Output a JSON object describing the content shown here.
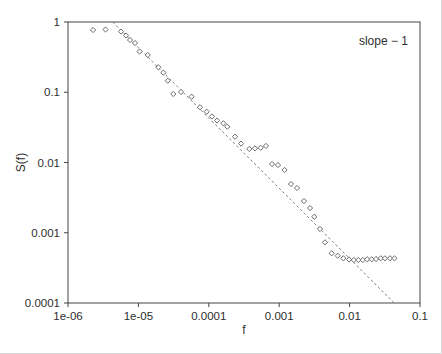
{
  "figure": {
    "background": "#ffffff",
    "frame_color": "#454545",
    "text_color": "#2e2e2e",
    "marker_color": "#6b6b6b",
    "marker_fill": "#ffffff",
    "dash_line_color": "#7d7d7d"
  },
  "chart_data": {
    "type": "scatter",
    "title": "",
    "xlabel": "f",
    "ylabel": "S(f)",
    "x_scale": "log",
    "y_scale": "log",
    "xlim": [
      1e-06,
      0.1
    ],
    "ylim": [
      0.0001,
      1
    ],
    "grid": false,
    "legend": "none",
    "x_ticks": [
      {
        "value": 1e-06,
        "label": "1e-06"
      },
      {
        "value": 1e-05,
        "label": "1e-05"
      },
      {
        "value": 0.0001,
        "label": "0.0001"
      },
      {
        "value": 0.001,
        "label": "0.001"
      },
      {
        "value": 0.01,
        "label": "0.01"
      },
      {
        "value": 0.1,
        "label": "0.1"
      }
    ],
    "y_ticks": [
      {
        "value": 1,
        "label": "1"
      },
      {
        "value": 0.1,
        "label": "0.1"
      },
      {
        "value": 0.01,
        "label": "0.01"
      },
      {
        "value": 0.001,
        "label": "0.001"
      },
      {
        "value": 0.0001,
        "label": "0.0001"
      }
    ],
    "annotation": {
      "text": "slope − 1",
      "f": 0.0675,
      "S": 0.47,
      "anchor": "end"
    },
    "reference_line": {
      "style": "dashed",
      "slope": -1,
      "points": [
        [
          4.3e-06,
          1.0
        ],
        [
          0.043,
          0.0001
        ]
      ]
    },
    "series": [
      {
        "name": "spectrum",
        "marker": "open-diamond",
        "points": [
          [
            2.27e-06,
            0.769
          ],
          [
            3.41e-06,
            0.782
          ],
          [
            5.66e-06,
            0.732
          ],
          [
            6.67e-06,
            0.642
          ],
          [
            7.6e-06,
            0.554
          ],
          [
            8.95e-06,
            0.502
          ],
          [
            1.04e-05,
            0.38
          ],
          [
            1.36e-05,
            0.339
          ],
          [
            1.92e-05,
            0.227
          ],
          [
            2.26e-05,
            0.19
          ],
          [
            2.61e-05,
            0.146
          ],
          [
            3.13e-05,
            0.0944
          ],
          [
            4.03e-05,
            0.101
          ],
          [
            5.71e-05,
            0.0864
          ],
          [
            7.5e-05,
            0.0611
          ],
          [
            9.34e-05,
            0.0529
          ],
          [
            0.000111,
            0.0452
          ],
          [
            0.000131,
            0.0396
          ],
          [
            0.000161,
            0.0361
          ],
          [
            0.000183,
            0.0323
          ],
          [
            0.000236,
            0.0233
          ],
          [
            0.000287,
            0.0186
          ],
          [
            0.000376,
            0.0156
          ],
          [
            0.000453,
            0.0159
          ],
          [
            0.000546,
            0.0162
          ],
          [
            0.000649,
            0.0172
          ],
          [
            0.00079,
            0.00952
          ],
          [
            0.000962,
            0.00921
          ],
          [
            0.00119,
            0.00782
          ],
          [
            0.00147,
            0.00494
          ],
          [
            0.00179,
            0.00434
          ],
          [
            0.00225,
            0.00283
          ],
          [
            0.00274,
            0.00225
          ],
          [
            0.00315,
            0.00169
          ],
          [
            0.0038,
            0.00113
          ],
          [
            0.00447,
            0.000731
          ],
          [
            0.00557,
            0.00051
          ],
          [
            0.00678,
            0.000471
          ],
          [
            0.00814,
            0.000433
          ],
          [
            0.00981,
            0.000416
          ],
          [
            0.0115,
            0.000409
          ],
          [
            0.0133,
            0.000409
          ],
          [
            0.0154,
            0.000409
          ],
          [
            0.0178,
            0.000419
          ],
          [
            0.0206,
            0.000419
          ],
          [
            0.0237,
            0.000423
          ],
          [
            0.0277,
            0.000433
          ],
          [
            0.0318,
            0.000433
          ],
          [
            0.0375,
            0.000433
          ],
          [
            0.0434,
            0.000433
          ]
        ]
      }
    ]
  }
}
